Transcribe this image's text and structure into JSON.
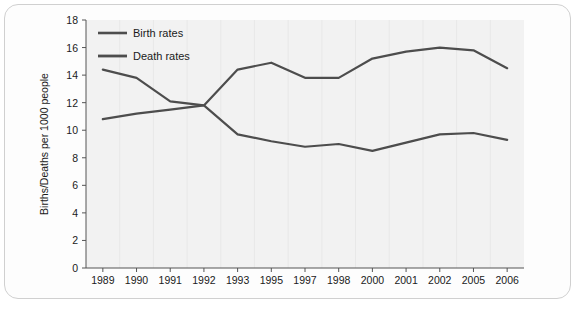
{
  "chart_data": {
    "type": "line",
    "title": "",
    "subtitle": "",
    "xlabel": "",
    "ylabel": "Births/Deaths per 1000 people",
    "categories": [
      "1989",
      "1990",
      "1991",
      "1992",
      "1993",
      "1995",
      "1997",
      "1998",
      "2000",
      "2001",
      "2002",
      "2005",
      "2006"
    ],
    "series": [
      {
        "name": "Birth rates",
        "color": "#4d4d4d",
        "values": [
          10.8,
          11.2,
          11.5,
          11.8,
          14.4,
          14.9,
          13.8,
          13.8,
          15.2,
          15.7,
          16.0,
          15.8,
          14.5
        ]
      },
      {
        "name": "Death rates",
        "color": "#4d4d4d",
        "values": [
          14.4,
          13.8,
          12.1,
          11.8,
          9.7,
          9.2,
          8.8,
          9.0,
          8.5,
          9.1,
          9.7,
          9.8,
          9.3
        ]
      }
    ],
    "ylim": [
      0,
      18
    ],
    "yticks": [
      "0",
      "2",
      "4",
      "6",
      "8",
      "10",
      "12",
      "14",
      "16",
      "18"
    ],
    "grid": false,
    "legend_position": "top-left",
    "plot_background": "#f2f2f2",
    "axis_color": "#555555"
  },
  "legend": {
    "items": [
      {
        "label": "Birth rates"
      },
      {
        "label": "Death rates"
      }
    ]
  },
  "frame": {
    "border_color": "#d0d0d0"
  }
}
